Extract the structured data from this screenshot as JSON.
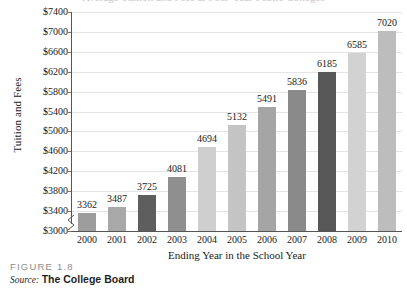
{
  "figure": {
    "label": "FIGURE 1.8",
    "source_word": "Source:",
    "source_text": "The College Board",
    "clipped_title": "Average Tuition and Fees at Four-Year Public Colleges"
  },
  "chart_data": {
    "type": "bar",
    "title": "",
    "xlabel": "Ending Year in the School Year",
    "ylabel": "Tuition and Fees",
    "categories": [
      "2000",
      "2001",
      "2002",
      "2003",
      "2004",
      "2005",
      "2006",
      "2007",
      "2008",
      "2009",
      "2010"
    ],
    "values": [
      3362,
      3487,
      3725,
      4081,
      4694,
      5132,
      5491,
      5836,
      6185,
      6585,
      7020
    ],
    "value_labels": [
      "3362",
      "3487",
      "3725",
      "4081",
      "4694",
      "5132",
      "5491",
      "5836",
      "6185",
      "6585",
      "7020"
    ],
    "bar_colors": [
      "#9d9d9d",
      "#a8a8a8",
      "#5e5e5e",
      "#8f8f8f",
      "#cfcfcf",
      "#c4c4c4",
      "#a5a5a5",
      "#8a8a8a",
      "#575757",
      "#d2d2d2",
      "#bdbdbd"
    ],
    "ylim": [
      3000,
      7400
    ],
    "ytick_values": [
      3000,
      3400,
      3800,
      4200,
      4600,
      5000,
      5400,
      5800,
      6200,
      6600,
      7000,
      7400
    ],
    "ytick_labels": [
      "$3000",
      "$3400",
      "$3800",
      "$4200",
      "$4600",
      "$5000",
      "$5400",
      "$5800",
      "$6200",
      "$6600",
      "$7000",
      "$7400"
    ],
    "grid": true,
    "grid_axis": "y",
    "legend": "none",
    "axis_break": true,
    "axis_break_note": "y-axis broken below $3000"
  },
  "colors": {
    "gridline": "#e4e4e4",
    "axis": "#555555",
    "text": "#1a1a1a",
    "caption_label": "#8d8d8d"
  }
}
